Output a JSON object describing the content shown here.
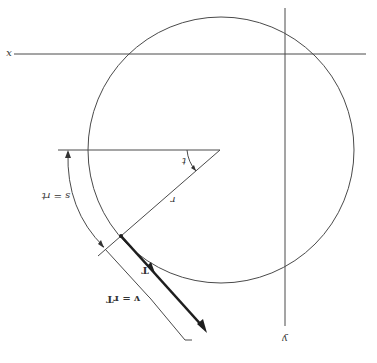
{
  "diagram": {
    "orientation": "rotated-180",
    "colors": {
      "background": "#ffffff",
      "line": "#4a4a4a",
      "vector": "#1e1e1e"
    },
    "axes": {
      "x_label": "x",
      "y_label": "y"
    },
    "circle": {
      "center": [
        221,
        150
      ],
      "radius": 133
    },
    "labels": {
      "theta": "t",
      "radius": "r",
      "arc_length": "s = rt",
      "tangent_unit": "T",
      "velocity": "v = rT"
    }
  }
}
